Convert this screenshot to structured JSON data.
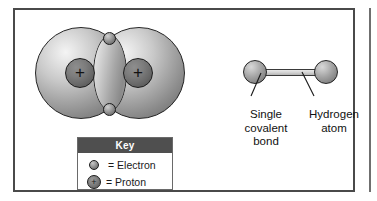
{
  "figure": {
    "type": "science-illustration",
    "space_filling_model": {
      "name": "space-filling-h2-model",
      "atoms": [
        {
          "id": "left-atom",
          "nucleus_symbol": "+"
        },
        {
          "id": "right-atom",
          "nucleus_symbol": "+"
        }
      ],
      "shared_electrons": 2
    },
    "ball_and_stick_model": {
      "name": "ball-and-stick-h2-model",
      "atoms": 2,
      "bonds": 1
    },
    "callouts": [
      {
        "id": "covalent-bond",
        "text": "Single\ncovalent\nbond",
        "lines": [
          "Single",
          "covalent",
          "bond"
        ]
      },
      {
        "id": "hydrogen-atom",
        "text": "Hydrogen\natom",
        "lines": [
          "Hydrogen",
          "atom"
        ]
      }
    ]
  },
  "key": {
    "title": "Key",
    "rows": [
      {
        "swatch": "electron-dot",
        "label": "= Electron"
      },
      {
        "swatch": "proton-dot",
        "label": "= Proton",
        "symbol": "+"
      }
    ]
  },
  "labels": {
    "covalent_bond_line1": "Single",
    "covalent_bond_line2": "covalent",
    "covalent_bond_line3": "bond",
    "hydrogen_atom_line1": "Hydrogen",
    "hydrogen_atom_line2": "atom"
  },
  "symbols": {
    "proton_plus": "+"
  },
  "colors": {
    "panel_border": "#4a4a4a",
    "key_header_bg": "#4f4f4f",
    "key_header_text": "#ffffff",
    "text": "#111111",
    "background": "#ffffff"
  }
}
